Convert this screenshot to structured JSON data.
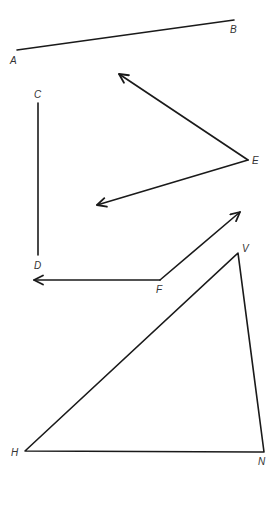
{
  "figure": {
    "segment_AB": {
      "start_label": "A",
      "end_label": "B"
    },
    "segment_CD": {
      "start_label": "C",
      "end_label": "D"
    },
    "angle_E": {
      "vertex_label": "E",
      "type": "two rays from vertex"
    },
    "angle_F": {
      "vertex_label": "F",
      "type": "two rays from vertex"
    },
    "triangle_HVN": {
      "vertices": [
        "H",
        "V",
        "N"
      ]
    }
  },
  "labels": {
    "A": "A",
    "B": "B",
    "C": "C",
    "D": "D",
    "E": "E",
    "F": "F",
    "V": "V",
    "H": "H",
    "N": "N"
  },
  "colors": {
    "stroke": "#1a1a1a",
    "label": "#333333",
    "background": "#ffffff"
  }
}
